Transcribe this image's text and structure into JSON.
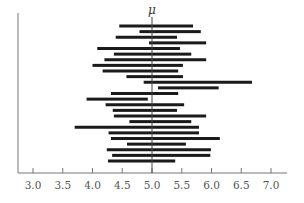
{
  "chart_data": {
    "type": "interval",
    "title": "",
    "xlabel": "",
    "ylabel": "",
    "xlim": [
      2.75,
      7.3
    ],
    "grid": false,
    "legend": null,
    "reference_line": {
      "label": "μ",
      "x": 5.0
    },
    "x_ticks": [
      3.0,
      3.5,
      4.0,
      4.5,
      5.0,
      5.5,
      6.0,
      6.5,
      7.0
    ],
    "x_tick_labels": [
      "3.0",
      "3.5",
      "4.0",
      "4.5",
      "5.0",
      "5.5",
      "6.0",
      "6.5",
      "7.0"
    ],
    "intervals": [
      {
        "low": 4.45,
        "high": 5.69
      },
      {
        "low": 4.79,
        "high": 5.82
      },
      {
        "low": 4.39,
        "high": 5.42
      },
      {
        "low": 4.95,
        "high": 5.91
      },
      {
        "low": 4.08,
        "high": 5.47
      },
      {
        "low": 4.36,
        "high": 5.66
      },
      {
        "low": 4.2,
        "high": 5.91
      },
      {
        "low": 4.0,
        "high": 5.52
      },
      {
        "low": 4.17,
        "high": 5.44
      },
      {
        "low": 4.57,
        "high": 5.52
      },
      {
        "low": 4.86,
        "high": 6.68
      },
      {
        "low": 5.1,
        "high": 6.12
      },
      {
        "low": 4.31,
        "high": 5.44
      },
      {
        "low": 3.9,
        "high": 4.93
      },
      {
        "low": 4.22,
        "high": 5.54
      },
      {
        "low": 4.34,
        "high": 5.42
      },
      {
        "low": 4.36,
        "high": 5.91
      },
      {
        "low": 4.62,
        "high": 5.66
      },
      {
        "low": 3.7,
        "high": 5.79
      },
      {
        "low": 4.27,
        "high": 5.79
      },
      {
        "low": 4.31,
        "high": 6.14
      },
      {
        "low": 4.58,
        "high": 5.57
      },
      {
        "low": 4.24,
        "high": 5.99
      },
      {
        "low": 4.33,
        "high": 5.98
      },
      {
        "low": 4.26,
        "high": 5.39
      }
    ]
  },
  "colors": {
    "bar": "#1a1a1a",
    "axis": "#777777",
    "reference_line": "#444444",
    "tick_label": "#555555"
  }
}
